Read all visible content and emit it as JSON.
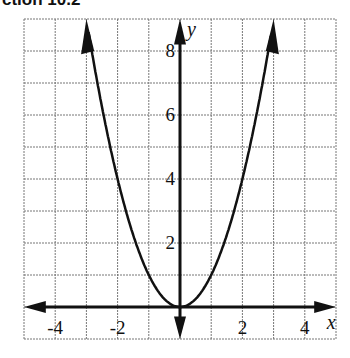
{
  "header": {
    "title": "ction 10.2"
  },
  "chart_data": {
    "type": "line",
    "title": "",
    "xlabel": "x",
    "ylabel": "y",
    "xlim": [
      -5,
      5
    ],
    "ylim": [
      -1,
      9
    ],
    "grid": true,
    "x_ticks": [
      "-4",
      "-2",
      "2",
      "4"
    ],
    "y_ticks": [
      "2",
      "4",
      "6",
      "8"
    ],
    "series": [
      {
        "name": "y = x^2",
        "x": [
          -3,
          -2,
          -1,
          0,
          1,
          2,
          3
        ],
        "y": [
          9,
          4,
          1,
          0,
          1,
          4,
          9
        ]
      }
    ]
  }
}
